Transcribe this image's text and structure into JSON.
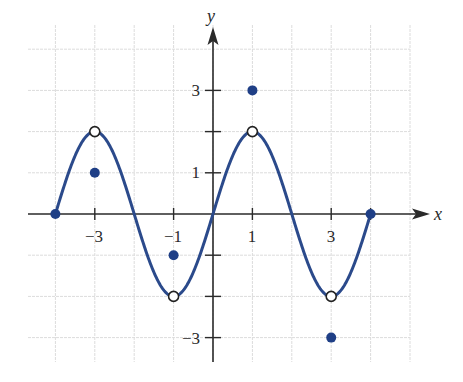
{
  "chart_data": {
    "type": "line",
    "title": "",
    "xlabel": "x",
    "ylabel": "y",
    "xlim": [
      -4.5,
      5.5
    ],
    "ylim": [
      -3.6,
      4.6
    ],
    "grid": true,
    "x_tick_labels": [
      {
        "value": -3,
        "label": "−3"
      },
      {
        "value": -1,
        "label": "−1"
      },
      {
        "value": 1,
        "label": "1"
      },
      {
        "value": 3,
        "label": "3"
      }
    ],
    "y_tick_labels": [
      {
        "value": 3,
        "label": "3"
      },
      {
        "value": 1,
        "label": "1"
      },
      {
        "value": -3,
        "label": "−3"
      }
    ],
    "y_ticks_unlabeled": [
      2,
      -1,
      -2
    ],
    "series": [
      {
        "name": "curve",
        "kind": "line",
        "description": "sinusoid through (−4,0), peaks at x=−3 and x=1, troughs at x=−1 and x=3",
        "x": [
          -4,
          -3.5,
          -3,
          -2.5,
          -2,
          -1.5,
          -1,
          -0.5,
          0,
          0.5,
          1,
          1.5,
          2,
          2.5,
          3,
          3.5,
          4
        ],
        "y": [
          0,
          1.41,
          2,
          1.41,
          0,
          -1.41,
          -2,
          -1.41,
          0,
          1.41,
          2,
          1.41,
          0,
          -1.41,
          -2,
          -1.41,
          0
        ]
      },
      {
        "name": "open-circles",
        "kind": "scatter-open",
        "points": [
          [
            -3,
            2
          ],
          [
            -1,
            -2
          ],
          [
            1,
            2
          ],
          [
            3,
            -2
          ]
        ]
      },
      {
        "name": "filled-dots",
        "kind": "scatter-filled",
        "points": [
          [
            -4,
            0
          ],
          [
            -3,
            1
          ],
          [
            -1,
            -1
          ],
          [
            1,
            3
          ],
          [
            3,
            -3
          ],
          [
            4,
            0
          ]
        ]
      }
    ],
    "colors": {
      "curve": "#2b4a8b",
      "dots": "#1f3f86",
      "axes": "#2a2a2a",
      "grid": "#dcdcdc"
    }
  },
  "labels": {
    "x_axis": "x",
    "y_axis": "y"
  }
}
